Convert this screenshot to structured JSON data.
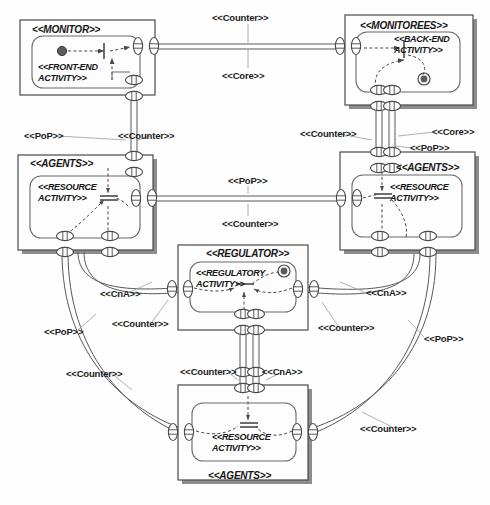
{
  "diagram": {
    "type": "uml-component-collaboration-diagram",
    "background": "#fefefe",
    "line_color": "#4a4a4a",
    "text_color": "#161616"
  },
  "components": [
    {
      "id": "monitor",
      "name": "<<MONITOR>>",
      "activity": "<<FRONT-END ACTIVITY>>",
      "activity_line1": "<<FRONT-END",
      "activity_line2": "ACTIVITY>>",
      "label_position": "top-left",
      "has_shadow": false,
      "has_initial_node": true,
      "x": 20,
      "y": 20,
      "w": 135,
      "h": 75
    },
    {
      "id": "monitorees",
      "name": "<<MONITOREES>>",
      "activity": "<<BACK-END ACTIVITY>>",
      "activity_line1": "<<BACK-END",
      "activity_line2": "ACTIVITY>>",
      "label_position": "top-center",
      "has_shadow": true,
      "has_final_node": true,
      "x": 345,
      "y": 15,
      "w": 128,
      "h": 90
    },
    {
      "id": "agents-left",
      "name": "<<AGENTS>>",
      "activity": "<<RESOURCE ACTIVITY>>",
      "activity_line1": "<<RESOURCE",
      "activity_line2": "ACTIVITY>>",
      "label_position": "top-left",
      "has_shadow": true,
      "x": 18,
      "y": 155,
      "w": 135,
      "h": 95
    },
    {
      "id": "agents-right",
      "name": "<<AGENTS>>",
      "activity": "<<RESOURCE ACTIVITY>>",
      "activity_line1": "<<RESOURCE",
      "activity_line2": "ACTIVITY>>",
      "label_position": "top-right",
      "has_shadow": true,
      "x": 340,
      "y": 152,
      "w": 135,
      "h": 98
    },
    {
      "id": "regulator",
      "name": "<<REGULATOR>>",
      "activity": "<<REGULATORY ACTIVITY>>",
      "activity_line1": "<<REGULATORY",
      "activity_line2": "ACTIVITY>>",
      "label_position": "top-center",
      "has_shadow": false,
      "has_final_node": true,
      "x": 178,
      "y": 245,
      "w": 130,
      "h": 85
    },
    {
      "id": "agents-bottom",
      "name": "<<AGENTS>>",
      "activity": "<<RESOURCE ACTIVITY>>",
      "activity_line1": "<<RESOURCE",
      "activity_line2": "ACTIVITY>>",
      "label_position": "bottom-center",
      "has_shadow": true,
      "x": 178,
      "y": 385,
      "w": 130,
      "h": 95
    }
  ],
  "connector_labels": [
    {
      "id": "l01",
      "text": "<<Counter>>",
      "x": 212,
      "y": 12
    },
    {
      "id": "l02",
      "text": "<<Core>>",
      "x": 222,
      "y": 70
    },
    {
      "id": "l03",
      "text": "<<PoP>>",
      "x": 24,
      "y": 130
    },
    {
      "id": "l04",
      "text": "<<Counter>>",
      "x": 118,
      "y": 130
    },
    {
      "id": "l05",
      "text": "<<Counter>>",
      "x": 300,
      "y": 128
    },
    {
      "id": "l06",
      "text": "<<Core>>",
      "x": 432,
      "y": 126
    },
    {
      "id": "l07",
      "text": "<<PoP>>",
      "x": 410,
      "y": 142
    },
    {
      "id": "l08",
      "text": "<<PoP>>",
      "x": 228,
      "y": 175
    },
    {
      "id": "l09",
      "text": "<<Counter>>",
      "x": 222,
      "y": 218
    },
    {
      "id": "l10",
      "text": "<<CnA>>",
      "x": 100,
      "y": 288
    },
    {
      "id": "l11",
      "text": "<<Counter>>",
      "x": 112,
      "y": 318
    },
    {
      "id": "l12",
      "text": "<<PoP>>",
      "x": 44,
      "y": 326
    },
    {
      "id": "l13",
      "text": "<<CnA>>",
      "x": 366,
      "y": 287
    },
    {
      "id": "l14",
      "text": "<<Counter>>",
      "x": 318,
      "y": 322
    },
    {
      "id": "l15",
      "text": "<<PoP>>",
      "x": 424,
      "y": 333
    },
    {
      "id": "l16",
      "text": "<<Counter>>",
      "x": 66,
      "y": 368
    },
    {
      "id": "l17",
      "text": "<<Counter>>",
      "x": 180,
      "y": 366
    },
    {
      "id": "l18",
      "text": "<<CnA>>",
      "x": 262,
      "y": 366
    },
    {
      "id": "l19",
      "text": "<<Counter>>",
      "x": 360,
      "y": 423
    }
  ]
}
